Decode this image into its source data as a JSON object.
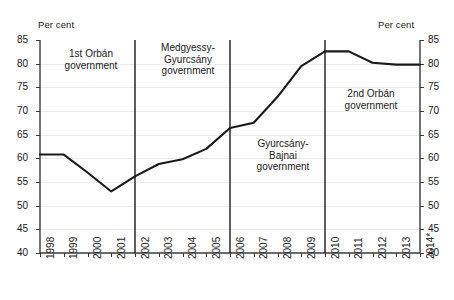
{
  "axis": {
    "unit_left": "Per cent",
    "unit_right": "Per cent",
    "y_ticks": [
      "85",
      "80",
      "75",
      "70",
      "65",
      "60",
      "55",
      "50",
      "45",
      "40"
    ],
    "x_ticks": [
      "1998",
      "1999",
      "2000",
      "2001",
      "2002",
      "2003",
      "2004",
      "2005",
      "2006",
      "2007",
      "2008",
      "2009",
      "2010",
      "2011",
      "2012",
      "2013",
      "2014*"
    ]
  },
  "annotations": [
    {
      "text": "1st Orbán\ngovernment"
    },
    {
      "text": "Medgyessy-\nGyurcsány\ngovernment"
    },
    {
      "text": "Gyurcsány-\nBajnai\ngovernment"
    },
    {
      "text": "2nd Orbán\ngovernment"
    }
  ],
  "colors": {
    "line": "#1a1a1a",
    "axis": "#3a3a3a",
    "grid": "#ececec",
    "divider": "#1a1a1a"
  },
  "chart_data": {
    "type": "line",
    "title": "",
    "xlabel": "",
    "ylabel": "Per cent",
    "ylim": [
      40,
      85
    ],
    "ytick_step": 5,
    "grid": true,
    "legend": "none",
    "dual_axis": true,
    "x": [
      "1998",
      "1999",
      "2000",
      "2001",
      "2002",
      "2003",
      "2004",
      "2005",
      "2006",
      "2007",
      "2008",
      "2009",
      "2010",
      "2011",
      "2012",
      "2013",
      "2014*"
    ],
    "series": [
      {
        "name": "Government debt",
        "values": [
          60.8,
          60.8,
          57.0,
          53.0,
          56.2,
          58.8,
          59.8,
          62.0,
          66.4,
          67.5,
          73.0,
          79.5,
          82.6,
          82.6,
          80.2,
          79.8,
          79.8
        ]
      }
    ],
    "vertical_dividers": [
      "2002",
      "2006",
      "2010"
    ],
    "annotations": [
      {
        "label": "1st Orbán government",
        "span": [
          "1998",
          "2002"
        ]
      },
      {
        "label": "Medgyessy-Gyurcsány government",
        "span": [
          "2002",
          "2006"
        ]
      },
      {
        "label": "Gyurcsány-Bajnai government",
        "span": [
          "2006",
          "2010"
        ]
      },
      {
        "label": "2nd Orbán government",
        "span": [
          "2010",
          "2014*"
        ]
      }
    ]
  }
}
